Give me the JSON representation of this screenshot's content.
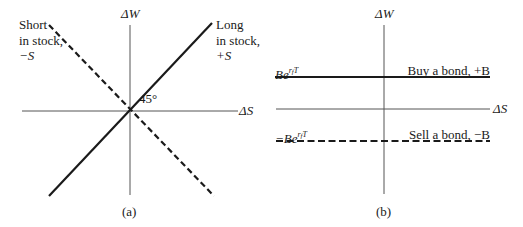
{
  "panel_a": {
    "caption": "(a)",
    "y_axis_label": "ΔW",
    "x_axis_label": "ΔS",
    "angle_label": "45°",
    "long_label": {
      "line1": "Long",
      "line2": "in stock,",
      "line3": "+S"
    },
    "short_label": {
      "line1": "Short",
      "line2": "in stock,",
      "line3": "−S"
    },
    "lines": [
      {
        "name": "long-stock",
        "style": "solid",
        "slope": 1
      },
      {
        "name": "short-stock",
        "style": "dashed",
        "slope": -1
      }
    ]
  },
  "panel_b": {
    "caption": "(b)",
    "y_axis_label": "ΔW",
    "x_axis_label": "ΔS",
    "buy_value": {
      "base": "Be",
      "sup_main": "r",
      "sup_sub": "f",
      "sup_tail": "T"
    },
    "sell_value": {
      "base": "−Be",
      "sup_main": "r",
      "sup_sub": "f",
      "sup_tail": "T"
    },
    "buy_label": "Buy a bond, +B",
    "sell_label": "Sell a bond, −B",
    "lines": [
      {
        "name": "buy-bond",
        "style": "solid",
        "level": "Be^(rf T)"
      },
      {
        "name": "sell-bond",
        "style": "dashed",
        "level": "−Be^(rf T)"
      }
    ]
  },
  "colors": {
    "ink": "#1a1a1a",
    "axis": "#555555",
    "background": "#ffffff"
  }
}
